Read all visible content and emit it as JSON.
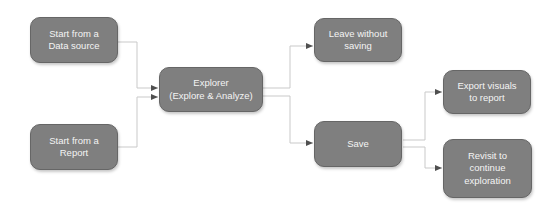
{
  "diagram": {
    "type": "flowchart",
    "colors": {
      "node_fill": "#7f7f7f",
      "node_border": "#666666",
      "node_text": "#f4f4f4",
      "connector": "#c9c9c9",
      "arrow": "#4f4f4f",
      "bg": "#ffffff"
    },
    "nodes": {
      "start_data_source": {
        "label": "Start from a\nData source"
      },
      "start_report": {
        "label": "Start from a\nReport"
      },
      "explorer": {
        "label": "Explorer\n(Explore & Analyze)"
      },
      "leave_without_saving": {
        "label": "Leave without\nsaving"
      },
      "save": {
        "label": "Save"
      },
      "export_visuals": {
        "label": "Export visuals\nto report"
      },
      "revisit": {
        "label": "Revisit to\ncontinue\nexploration"
      }
    },
    "edges": [
      {
        "from": "start_data_source",
        "to": "explorer"
      },
      {
        "from": "start_report",
        "to": "explorer"
      },
      {
        "from": "explorer",
        "to": "leave_without_saving"
      },
      {
        "from": "explorer",
        "to": "save"
      },
      {
        "from": "save",
        "to": "export_visuals"
      },
      {
        "from": "save",
        "to": "revisit"
      }
    ]
  }
}
